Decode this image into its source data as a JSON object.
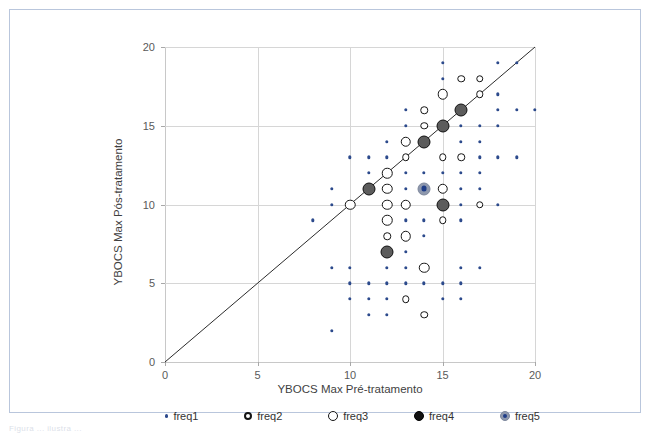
{
  "frame": {
    "border_color": "#b9c6dc"
  },
  "caption": {
    "text": "Figura ... ilustra ..."
  },
  "chart_data": {
    "type": "scatter",
    "title": "",
    "xlabel": "YBOCS Max Pré-tratamento",
    "ylabel": "YBOCS Max Pós-tratamento",
    "xlim": [
      0,
      20
    ],
    "ylim": [
      0,
      20
    ],
    "xticks": [
      0,
      5,
      10,
      15,
      20
    ],
    "yticks": [
      0,
      5,
      10,
      15,
      20
    ],
    "xticklabels": [
      "0",
      "5",
      "10",
      "15",
      "20"
    ],
    "yticklabels": [
      "0",
      "5",
      "10",
      "15",
      "20"
    ],
    "grid": true,
    "grid_axis": "both",
    "legend_position": "bottom",
    "reference_line": {
      "name": "identity-line",
      "from": [
        0,
        0
      ],
      "to": [
        20,
        20
      ],
      "color": "#2b2b2b"
    },
    "legend": [
      {
        "key": "freq1",
        "label": "freq1",
        "marker": "small-blue-dot",
        "size": 1,
        "fill": "#2c4a8c",
        "edge": "#2c4a8c"
      },
      {
        "key": "freq2",
        "label": "freq2",
        "marker": "small-open-circle",
        "size": 2,
        "fill": "#ffffff",
        "edge": "#141414"
      },
      {
        "key": "freq3",
        "label": "freq3",
        "marker": "open-circle",
        "size": 3,
        "fill": "#ffffff",
        "edge": "#141414"
      },
      {
        "key": "freq4",
        "label": "freq4",
        "marker": "filled-circle",
        "size": 4,
        "fill": "#5c5c5c",
        "edge": "#101010"
      },
      {
        "key": "freq5",
        "label": "freq5",
        "marker": "blue-core-circle",
        "size": 5,
        "fill": "#8e98ad",
        "edge": "#1f3d87"
      }
    ],
    "series": [
      {
        "name": "freq1",
        "freq": 1,
        "points": [
          [
            9,
            2
          ],
          [
            11,
            3
          ],
          [
            12,
            3
          ],
          [
            10,
            4
          ],
          [
            11,
            4
          ],
          [
            12,
            4
          ],
          [
            13,
            4
          ],
          [
            15,
            4
          ],
          [
            16,
            4
          ],
          [
            10,
            5
          ],
          [
            11,
            5
          ],
          [
            12,
            5
          ],
          [
            13,
            5
          ],
          [
            14,
            5
          ],
          [
            15,
            5
          ],
          [
            16,
            5
          ],
          [
            9,
            6
          ],
          [
            10,
            6
          ],
          [
            12,
            6
          ],
          [
            13,
            6
          ],
          [
            16,
            6
          ],
          [
            17,
            6
          ],
          [
            13,
            7
          ],
          [
            12,
            8
          ],
          [
            13,
            8
          ],
          [
            14,
            8
          ],
          [
            8,
            9
          ],
          [
            13,
            9
          ],
          [
            14,
            9
          ],
          [
            15,
            9
          ],
          [
            16,
            9
          ],
          [
            9,
            10
          ],
          [
            12,
            10
          ],
          [
            13,
            10
          ],
          [
            16,
            10
          ],
          [
            17,
            10
          ],
          [
            18,
            10
          ],
          [
            9,
            11
          ],
          [
            13,
            11
          ],
          [
            14,
            11
          ],
          [
            16,
            11
          ],
          [
            17,
            11
          ],
          [
            11,
            12
          ],
          [
            13,
            12
          ],
          [
            14,
            12
          ],
          [
            15,
            12
          ],
          [
            16,
            12
          ],
          [
            17,
            12
          ],
          [
            10,
            13
          ],
          [
            11,
            13
          ],
          [
            12,
            13
          ],
          [
            16,
            13
          ],
          [
            17,
            13
          ],
          [
            18,
            13
          ],
          [
            19,
            13
          ],
          [
            12,
            14
          ],
          [
            14,
            14
          ],
          [
            16,
            14
          ],
          [
            17,
            14
          ],
          [
            13,
            15
          ],
          [
            16,
            15
          ],
          [
            17,
            15
          ],
          [
            18,
            15
          ],
          [
            13,
            16
          ],
          [
            16,
            16
          ],
          [
            18,
            16
          ],
          [
            19,
            16
          ],
          [
            20,
            16
          ],
          [
            15,
            17
          ],
          [
            18,
            17
          ],
          [
            15,
            18
          ],
          [
            17,
            18
          ],
          [
            15,
            19
          ],
          [
            18,
            19
          ],
          [
            19,
            19
          ]
        ]
      },
      {
        "name": "freq2",
        "freq": 2,
        "points": [
          [
            14,
            3
          ],
          [
            13,
            4
          ],
          [
            12,
            8
          ],
          [
            15,
            9
          ],
          [
            12,
            11
          ],
          [
            17,
            10
          ],
          [
            12,
            12
          ],
          [
            13,
            13
          ],
          [
            15,
            13
          ],
          [
            16,
            13
          ],
          [
            14,
            15
          ],
          [
            14,
            16
          ],
          [
            16,
            18
          ],
          [
            17,
            17
          ],
          [
            17,
            18
          ]
        ]
      },
      {
        "name": "freq3",
        "freq": 3,
        "points": [
          [
            14,
            6
          ],
          [
            13,
            8
          ],
          [
            12,
            9
          ],
          [
            10,
            10
          ],
          [
            12,
            10
          ],
          [
            13,
            10
          ],
          [
            12,
            11
          ],
          [
            15,
            11
          ],
          [
            12,
            12
          ],
          [
            13,
            14
          ],
          [
            15,
            17
          ]
        ]
      },
      {
        "name": "freq4",
        "freq": 4,
        "points": [
          [
            12,
            7
          ],
          [
            15,
            10
          ],
          [
            11,
            11
          ],
          [
            14,
            14
          ],
          [
            15,
            15
          ],
          [
            16,
            16
          ]
        ]
      },
      {
        "name": "freq5",
        "freq": 5,
        "points": [
          [
            14,
            11
          ]
        ]
      }
    ]
  }
}
